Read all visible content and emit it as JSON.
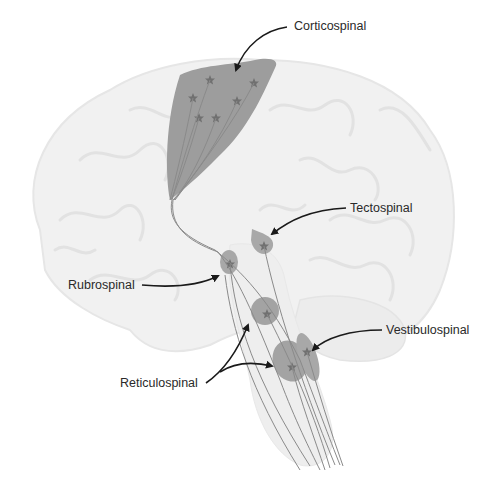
{
  "figure": {
    "labels": {
      "corticospinal": "Corticospinal",
      "tectospinal": "Tectospinal",
      "rubrospinal": "Rubrospinal",
      "vestibulospinal": "Vestibulospinal",
      "reticulospinal": "Reticulospinal"
    },
    "colors": {
      "brain_outline": "#ececec",
      "brain_gyri": "#e2e2e2",
      "nucleus_fill": "#a3a3a3",
      "cortex_fill": "#9d9d9d",
      "star": "#707070",
      "fiber": "#8a8a8a",
      "arrow": "#1a1a1a",
      "text": "#2a2a2a"
    }
  }
}
